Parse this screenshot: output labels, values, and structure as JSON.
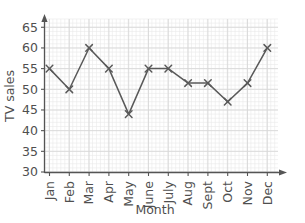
{
  "chart_data": {
    "type": "line",
    "title": "",
    "xlabel": "Month",
    "ylabel": "TV sales",
    "categories": [
      "Jan",
      "Feb",
      "Mar",
      "Apr",
      "May",
      "June",
      "July",
      "Aug",
      "Sept",
      "Oct",
      "Nov",
      "Dec"
    ],
    "values": [
      55,
      50,
      60,
      55,
      44,
      55,
      55,
      51.5,
      51.5,
      47,
      51.5,
      60
    ],
    "series": [
      {
        "name": "TV sales",
        "values": [
          55,
          50,
          60,
          55,
          44,
          55,
          55,
          51.5,
          51.5,
          47,
          51.5,
          60
        ]
      }
    ],
    "ylim": [
      30,
      67
    ],
    "yticks": [
      30,
      35,
      40,
      45,
      50,
      55,
      60,
      65
    ],
    "ytick_labels": [
      "30",
      "35",
      "40",
      "45",
      "50",
      "55",
      "60",
      "65"
    ],
    "grid": true,
    "grid_minor": true,
    "legend": "none",
    "marker": "x",
    "line_color": "#595959",
    "grid_color": "#d8d8d8",
    "grid_minor_color": "#e9e9e9",
    "axis_color": "#555555"
  },
  "axes": {
    "y_label": "TV sales",
    "x_label": "Month"
  }
}
